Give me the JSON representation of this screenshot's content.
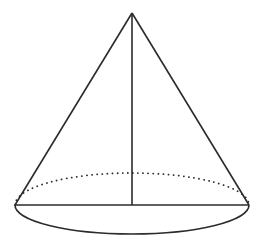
{
  "diagram": {
    "type": "cone",
    "apex": {
      "x": 132,
      "y": 13
    },
    "base": {
      "cx": 132,
      "cy": 205,
      "rx": 117,
      "ry": 29
    },
    "height_line": true,
    "radius_line": true,
    "hidden_edge_style": "dotted",
    "stroke_color": "#2b2b2b",
    "background_color": "#ffffff"
  }
}
